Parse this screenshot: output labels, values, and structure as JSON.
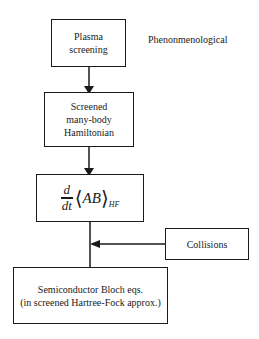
{
  "diagram": {
    "type": "flowchart",
    "side_label": "Phenonmenological",
    "nodes": [
      {
        "id": "plasma",
        "text": "Plasma\nscreening"
      },
      {
        "id": "hamiltonian",
        "text": "Screened\nmany-body\nHamiltonian"
      },
      {
        "id": "eom",
        "formula": {
          "numerator": "d",
          "denominator": "dt",
          "left_bracket": "⟨",
          "expr": "AB",
          "right_bracket": "⟩",
          "subscript": "HF"
        }
      },
      {
        "id": "collisions",
        "text": "Collisions"
      },
      {
        "id": "sbe",
        "text": "Semiconductor Bloch eqs.\n(in screened Hartree-Fock approx.)"
      }
    ],
    "edges": [
      {
        "from": "plasma",
        "to": "hamiltonian"
      },
      {
        "from": "hamiltonian",
        "to": "eom"
      },
      {
        "from": "eom",
        "to": "sbe"
      },
      {
        "from": "collisions",
        "to": "eom-sbe-line"
      }
    ]
  }
}
